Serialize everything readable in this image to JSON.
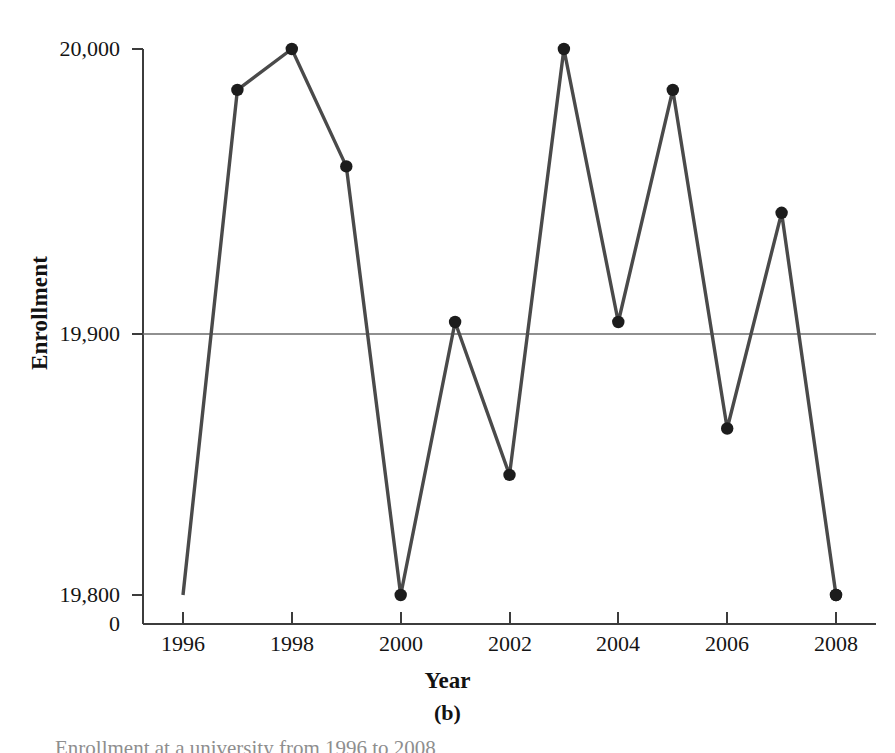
{
  "figure": {
    "panel_label": "(b)",
    "caption_partial": "Enrollment at a university from 1996 to 2008",
    "x_axis_title": "Year",
    "y_axis_title": "Enrollment"
  },
  "axes": {
    "y_ticks": [
      "20,000",
      "19,900",
      "19,800"
    ],
    "y_origin_label": "0",
    "x_ticks": [
      "1996",
      "1998",
      "2000",
      "2002",
      "2004",
      "2006",
      "2008"
    ],
    "gridline_value": "19,900"
  },
  "colors": {
    "line": "#4a4a4a",
    "marker": "#1c1c1c",
    "axis": "#3c3c3c",
    "gridline": "#6b6b6b",
    "background": "#ffffff"
  },
  "chart_data": {
    "type": "line",
    "title": "",
    "xlabel": "Year",
    "ylabel": "Enrollment",
    "x": [
      1996,
      1997,
      1998,
      1999,
      2000,
      2001,
      2002,
      2003,
      2004,
      2005,
      2006,
      2007,
      2008
    ],
    "values": [
      19800,
      19985,
      20000,
      19957,
      19800,
      19900,
      19844,
      20000,
      19900,
      19985,
      19861,
      19940,
      19800
    ],
    "series": [
      {
        "name": "Enrollment",
        "values": [
          19800,
          19985,
          20000,
          19957,
          19800,
          19900,
          19844,
          20000,
          19900,
          19985,
          19861,
          19940,
          19800
        ]
      }
    ],
    "xlim": [
      1995.5,
      2008.5
    ],
    "ylim": [
      19780,
      20005
    ],
    "y_tick_values": [
      19800,
      19900,
      20000
    ],
    "x_tick_values": [
      1996,
      1998,
      2000,
      2002,
      2004,
      2006,
      2008
    ],
    "grid": "single horizontal reference line at 19,900",
    "axis_break": "y-axis broken between 0 and 19,800",
    "legend": "none",
    "markers": "filled circles"
  }
}
